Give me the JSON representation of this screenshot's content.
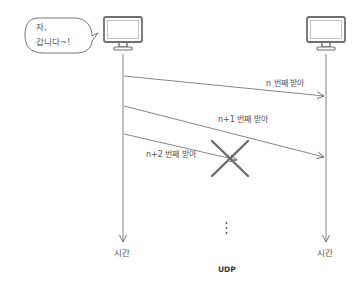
{
  "diagram": {
    "type": "sequence",
    "caption": "UDP",
    "colors": {
      "line": "#666666",
      "monitor": "#707070",
      "cross": "#6b6b6b",
      "text": "#555555"
    },
    "sender": {
      "icon": "monitor-icon",
      "speech_bubble": {
        "line1": "자,",
        "line2": "갑니다~!"
      },
      "time_label": "시간"
    },
    "receiver": {
      "icon": "monitor-icon",
      "time_label": "시간"
    },
    "messages": [
      {
        "label": "n 번째 받아",
        "delivered": true
      },
      {
        "label": "n+1 번째 받아",
        "delivered": true
      },
      {
        "label": "n+2 번째 받아",
        "delivered": false,
        "lost_marker": "cross-icon"
      }
    ],
    "continuation": "⋮"
  }
}
